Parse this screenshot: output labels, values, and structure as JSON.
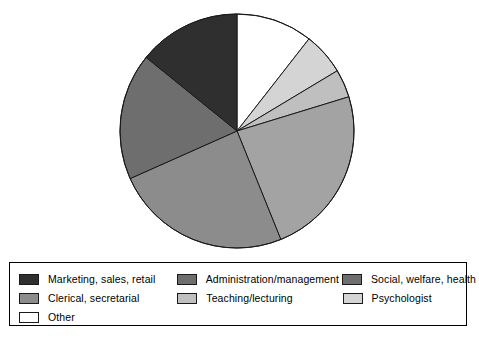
{
  "chart_data": {
    "type": "pie",
    "title": "",
    "subtitle": "",
    "xlabel": "",
    "ylabel": "",
    "grid": false,
    "legend_position": "bottom",
    "start_angle_deg": 0,
    "direction": "clockwise",
    "center": {
      "cx": 237,
      "cy": 131
    },
    "radius": 117,
    "categories": [
      "Other",
      "Psychologist",
      "Teaching/lecturing",
      "Social, welfare, health",
      "Clerical, secretarial",
      "Administration/management",
      "Marketing, sales, retail"
    ],
    "values": [
      10.6,
      5.8,
      3.9,
      23.6,
      24.4,
      17.5,
      14.2
    ],
    "angles_deg": [
      38,
      21,
      14,
      85,
      88,
      63,
      51
    ],
    "slices": [
      {
        "label": "Other",
        "value": 10.6,
        "angle_deg": 38,
        "start_deg": 0,
        "end_deg": 38,
        "color": "#ffffff"
      },
      {
        "label": "Psychologist",
        "value": 5.8,
        "angle_deg": 21,
        "start_deg": 38,
        "end_deg": 59,
        "color": "#d4d4d4"
      },
      {
        "label": "Teaching/lecturing",
        "value": 3.9,
        "angle_deg": 14,
        "start_deg": 59,
        "end_deg": 73,
        "color": "#bfbfbf"
      },
      {
        "label": "Social, welfare, health",
        "value": 23.6,
        "angle_deg": 85,
        "start_deg": 73,
        "end_deg": 158,
        "color": "#a3a3a3"
      },
      {
        "label": "Clerical, secretarial",
        "value": 24.4,
        "angle_deg": 88,
        "start_deg": 158,
        "end_deg": 246,
        "color": "#8c8c8c"
      },
      {
        "label": "Administration/management",
        "value": 17.5,
        "angle_deg": 63,
        "start_deg": 246,
        "end_deg": 309,
        "color": "#6e6e6e"
      },
      {
        "label": "Marketing, sales, retail",
        "value": 14.2,
        "angle_deg": 51,
        "start_deg": 309,
        "end_deg": 360,
        "color": "#2f2f2f"
      }
    ],
    "outline_color": "#1a1a1a"
  },
  "legend": {
    "rows": [
      [
        {
          "label": "Marketing, sales, retail",
          "color": "#2f2f2f"
        },
        {
          "label": "Administration/management",
          "color": "#6e6e6e"
        },
        {
          "label": "Social, welfare, health",
          "color": "#6e6e6e"
        }
      ],
      [
        {
          "label": "Clerical, secretarial",
          "color": "#8c8c8c"
        },
        {
          "label": "Teaching/lecturing",
          "color": "#bfbfbf"
        },
        {
          "label": "Psychologist",
          "color": "#d4d4d4"
        }
      ],
      [
        {
          "label": "Other",
          "color": "#ffffff"
        }
      ]
    ]
  }
}
